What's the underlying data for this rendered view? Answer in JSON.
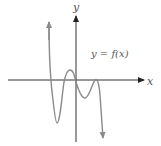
{
  "diagram": {
    "axis_x_label": "x",
    "axis_y_label": "y",
    "curve_label": "y = f(x)",
    "colors": {
      "axis": "#222222",
      "curve": "#8a8a8a",
      "label": "#666666"
    }
  }
}
